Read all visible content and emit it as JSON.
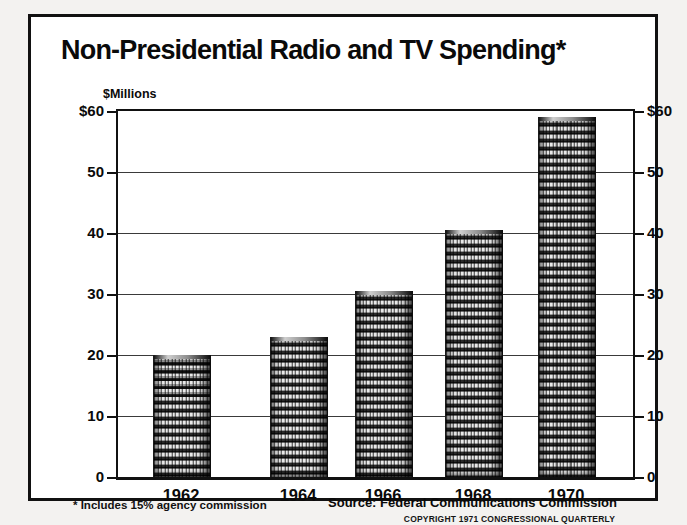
{
  "figure": {
    "title": "Non-Presidential Radio and TV Spending",
    "title_marker": "*",
    "footnote": "* Includes 15% agency commission",
    "source": "Source:  Federal Communications Commission",
    "copyright": "COPYRIGHT 1971 CONGRESSIONAL QUARTERLY",
    "accent_color": "#111111",
    "background_color": "#ffffff"
  },
  "chart_data": {
    "type": "bar",
    "title": "Non-Presidential Radio and TV Spending*",
    "xlabel": "",
    "ylabel": "$Millions",
    "ylim": [
      0,
      60
    ],
    "grid": true,
    "legend": "none",
    "categories": [
      "1962",
      "1964",
      "1966",
      "1968",
      "1970"
    ],
    "values": [
      20,
      23,
      30.5,
      40.5,
      59
    ],
    "yticks": [
      0,
      10,
      20,
      30,
      40,
      50,
      60
    ],
    "ytick_labels_left": [
      "0",
      "10",
      "20",
      "30",
      "40",
      "50",
      "$60"
    ],
    "ytick_labels_right": [
      "0",
      "10",
      "20",
      "30",
      "40",
      "50",
      "$60"
    ],
    "units": "millions of dollars",
    "annotations": [
      "* Includes 15% agency commission",
      "Source:  Federal Communications Commission",
      "COPYRIGHT 1971 CONGRESSIONAL QUARTERLY"
    ]
  }
}
